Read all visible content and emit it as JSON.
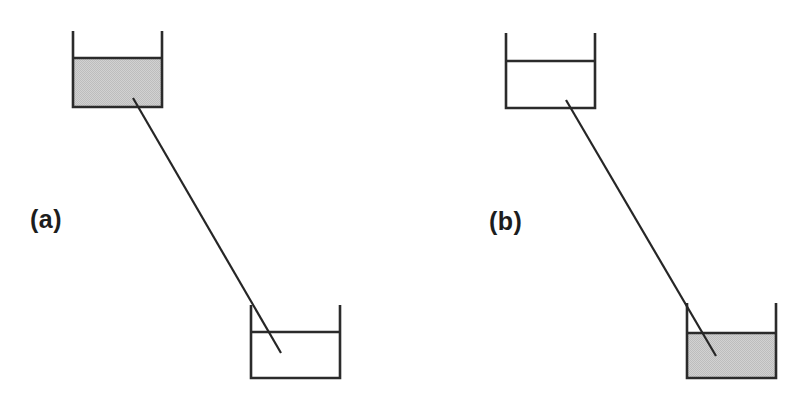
{
  "figure": {
    "background_color": "#ffffff",
    "stroke_color": "#2b2b2b",
    "line_color": "#262626",
    "liquid_fill_color": "#cccccc",
    "empty_fill_color": "#ffffff",
    "width": 799,
    "height": 399
  },
  "panels": [
    {
      "id": "a",
      "label": "(a)",
      "label_x": 30,
      "label_y": 228,
      "upper_vessel": {
        "name": "upper-vessel",
        "left": 73,
        "right": 162,
        "top": 31,
        "bottom": 107,
        "surface_y": 58,
        "filled": true,
        "fill_color": "#cccccc",
        "fill_state": "full"
      },
      "lower_vessel": {
        "name": "lower-vessel",
        "left": 251,
        "right": 340,
        "top": 305,
        "bottom": 378,
        "surface_y": 332,
        "filled": false,
        "fill_color": "#ffffff",
        "fill_state": "empty"
      },
      "transfer_line": {
        "name": "transfer-line",
        "x1": 133,
        "y1": 98,
        "x2": 281,
        "y2": 353
      }
    },
    {
      "id": "b",
      "label": "(b)",
      "label_x": 489,
      "label_y": 230,
      "upper_vessel": {
        "name": "upper-vessel",
        "left": 506,
        "right": 595,
        "top": 33,
        "bottom": 108,
        "surface_y": 61,
        "filled": false,
        "fill_color": "#ffffff",
        "fill_state": "empty"
      },
      "lower_vessel": {
        "name": "lower-vessel",
        "left": 687,
        "right": 776,
        "top": 303,
        "bottom": 378,
        "surface_y": 333,
        "filled": true,
        "fill_color": "#cccccc",
        "fill_state": "full"
      },
      "transfer_line": {
        "name": "transfer-line",
        "x1": 566,
        "y1": 100,
        "x2": 716,
        "y2": 356
      }
    }
  ]
}
